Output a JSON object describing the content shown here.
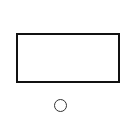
{
  "diagram": {
    "shapes": [
      {
        "type": "rectangle",
        "label": "",
        "stroke": "#111111",
        "fill": "#ffffff"
      },
      {
        "type": "circle",
        "label": "",
        "stroke": "#333333",
        "fill": "#ffffff"
      }
    ],
    "background": "#ffffff"
  }
}
